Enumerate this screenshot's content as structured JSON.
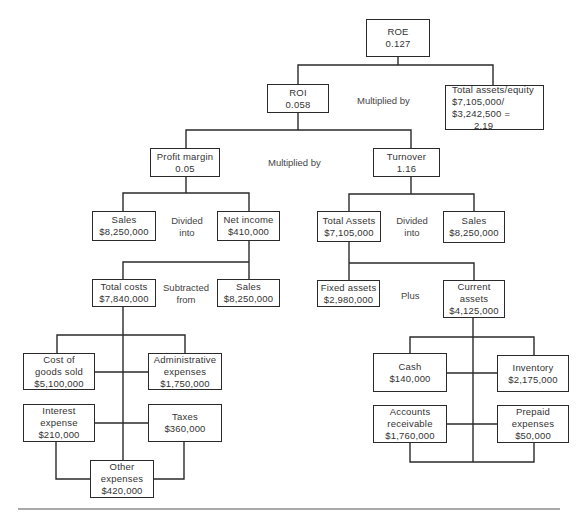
{
  "diagram": {
    "nodes": {
      "roe": {
        "label": "ROE",
        "value": "0.127"
      },
      "roi": {
        "label": "ROI",
        "value": "0.058"
      },
      "equity_multiplier": {
        "label": "Total assets/equity",
        "line2": "$7,105,000/",
        "line3": "$3,242,500 =",
        "value": "2.19"
      },
      "profit_margin": {
        "label": "Profit margin",
        "value": "0.05"
      },
      "turnover": {
        "label": "Turnover",
        "value": "1.16"
      },
      "sales_left": {
        "label": "Sales",
        "value": "$8,250,000"
      },
      "net_income": {
        "label": "Net income",
        "value": "$410,000"
      },
      "total_assets": {
        "label": "Total Assets",
        "value": "$7,105,000"
      },
      "sales_right": {
        "label": "Sales",
        "value": "$8,250,000"
      },
      "total_costs": {
        "label": "Total costs",
        "value": "$7,840,000"
      },
      "sales_costs": {
        "label": "Sales",
        "value": "$8,250,000"
      },
      "fixed_assets": {
        "label": "Fixed assets",
        "value": "$2,980,000"
      },
      "current_assets": {
        "label": "Current",
        "label2": "assets",
        "value": "$4,125,000"
      },
      "cogs": {
        "label": "Cost of",
        "label2": "goods sold",
        "value": "$5,100,000"
      },
      "admin": {
        "label": "Administrative",
        "label2": "expenses",
        "value": "$1,750,000"
      },
      "interest": {
        "label": "Interest",
        "label2": "expense",
        "value": "$210,000"
      },
      "taxes": {
        "label": "Taxes",
        "value": "$360,000"
      },
      "other": {
        "label": "Other",
        "label2": "expenses",
        "value": "$420,000"
      },
      "cash": {
        "label": "Cash",
        "value": "$140,000"
      },
      "inventory": {
        "label": "Inventory",
        "value": "$2,175,000"
      },
      "receivables": {
        "label": "Accounts",
        "label2": "receivable",
        "value": "$1,760,000"
      },
      "prepaid": {
        "label": "Prepaid",
        "label2": "expenses",
        "value": "$50,000"
      }
    },
    "operators": {
      "roe_op": "Multiplied by",
      "roi_op": "Multiplied by",
      "pm_op_1": "Divided",
      "pm_op_2": "into",
      "to_op_1": "Divided",
      "to_op_2": "into",
      "ni_op_1": "Subtracted",
      "ni_op_2": "from",
      "ta_op": "Plus"
    }
  }
}
